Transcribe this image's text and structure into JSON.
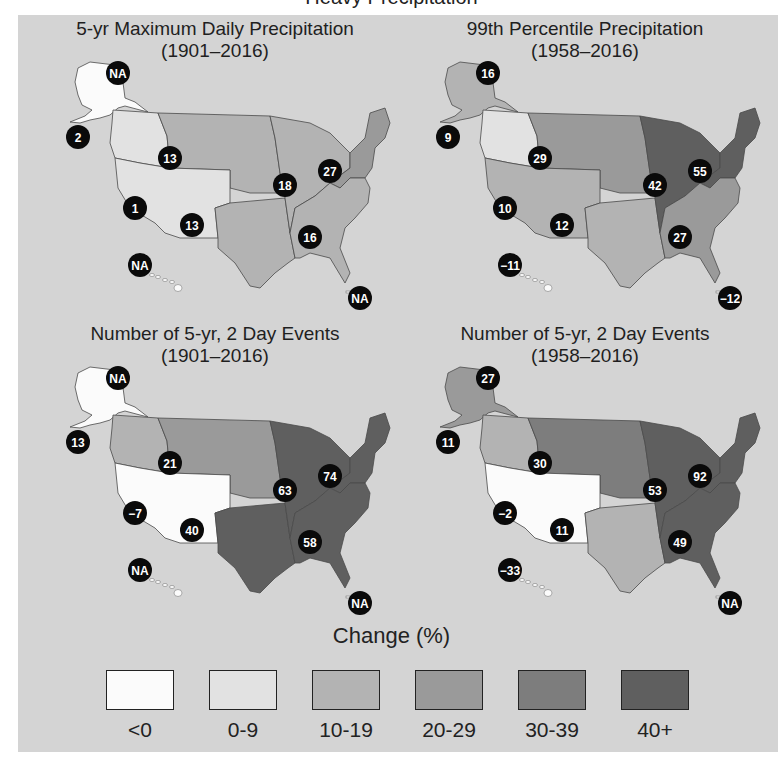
{
  "figure_title_clipped": "Heavy Precipitation",
  "maps": [
    {
      "title": "5-yr Maximum Daily Precipitation",
      "period": "(1901–2016)",
      "regions": {
        "alaska": {
          "value": "NA",
          "class": "<0"
        },
        "northwest": {
          "value": "2",
          "class": "0-9"
        },
        "southwest": {
          "value": "1",
          "class": "0-9"
        },
        "northern_great_plains": {
          "value": "13",
          "class": "10-19"
        },
        "southern_great_plains": {
          "value": "13",
          "class": "10-19"
        },
        "midwest": {
          "value": "18",
          "class": "10-19"
        },
        "northeast": {
          "value": "27",
          "class": "20-29"
        },
        "southeast": {
          "value": "16",
          "class": "10-19"
        },
        "hawaii": {
          "value": "NA",
          "class": "<0"
        },
        "caribbean": {
          "value": "NA",
          "class": "none"
        }
      }
    },
    {
      "title": "99th Percentile Precipitation",
      "period": "(1958–2016)",
      "regions": {
        "alaska": {
          "value": "16",
          "class": "10-19"
        },
        "northwest": {
          "value": "9",
          "class": "0-9"
        },
        "southwest": {
          "value": "10",
          "class": "10-19"
        },
        "northern_great_plains": {
          "value": "29",
          "class": "20-29"
        },
        "southern_great_plains": {
          "value": "12",
          "class": "10-19"
        },
        "midwest": {
          "value": "42",
          "class": "40+"
        },
        "northeast": {
          "value": "55",
          "class": "40+"
        },
        "southeast": {
          "value": "27",
          "class": "20-29"
        },
        "hawaii": {
          "value": "−11",
          "class": "<0"
        },
        "caribbean": {
          "value": "−12",
          "class": "none"
        }
      }
    },
    {
      "title": "Number of  5-yr, 2 Day Events",
      "period": "(1901–2016)",
      "regions": {
        "alaska": {
          "value": "NA",
          "class": "<0"
        },
        "northwest": {
          "value": "13",
          "class": "10-19"
        },
        "southwest": {
          "value": "−7",
          "class": "<0"
        },
        "northern_great_plains": {
          "value": "21",
          "class": "20-29"
        },
        "southern_great_plains": {
          "value": "40",
          "class": "40+"
        },
        "midwest": {
          "value": "63",
          "class": "40+"
        },
        "northeast": {
          "value": "74",
          "class": "40+"
        },
        "southeast": {
          "value": "58",
          "class": "40+"
        },
        "hawaii": {
          "value": "NA",
          "class": "<0"
        },
        "caribbean": {
          "value": "NA",
          "class": "none"
        }
      }
    },
    {
      "title": "Number of  5-yr, 2 Day Events",
      "period": "(1958–2016)",
      "regions": {
        "alaska": {
          "value": "27",
          "class": "20-29"
        },
        "northwest": {
          "value": "11",
          "class": "10-19"
        },
        "southwest": {
          "value": "−2",
          "class": "<0"
        },
        "northern_great_plains": {
          "value": "30",
          "class": "30-39"
        },
        "southern_great_plains": {
          "value": "11",
          "class": "10-19"
        },
        "midwest": {
          "value": "53",
          "class": "40+"
        },
        "northeast": {
          "value": "92",
          "class": "40+"
        },
        "southeast": {
          "value": "49",
          "class": "40+"
        },
        "hawaii": {
          "value": "−33",
          "class": "<0"
        },
        "caribbean": {
          "value": "NA",
          "class": "none"
        }
      }
    }
  ],
  "legend": {
    "title": "Change (%)",
    "items": [
      {
        "label": "<0",
        "color": "#fbfbfb"
      },
      {
        "label": "0-9",
        "color": "#e2e2e2"
      },
      {
        "label": "10-19",
        "color": "#b3b3b3"
      },
      {
        "label": "20-29",
        "color": "#9a9a9a"
      },
      {
        "label": "30-39",
        "color": "#7d7d7d"
      },
      {
        "label": "40+",
        "color": "#5f5f5f"
      }
    ]
  },
  "colors": {
    "background_panel": "#d4d4d4",
    "badge": "#0a0a0a",
    "badge_text": "#ffffff",
    "border": "#444444"
  }
}
